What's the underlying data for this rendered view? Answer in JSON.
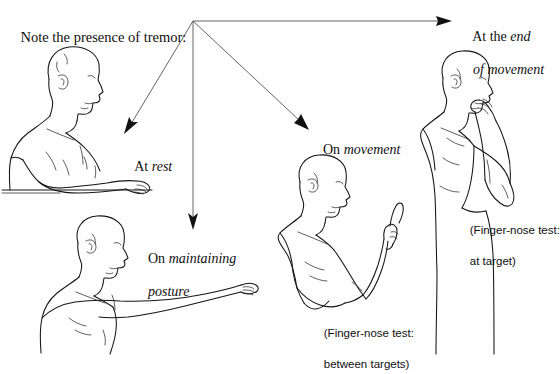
{
  "page": {
    "title": "Note the presence of tremor:",
    "background_color": "#fefefe",
    "ink_color": "#151515",
    "arrow_color": "#555555"
  },
  "header": {
    "text": "Note the presence of tremor:"
  },
  "labels": {
    "at_rest": {
      "prefix": "At ",
      "emphasis": "rest"
    },
    "on_maintaining_posture": {
      "prefix": "On ",
      "emphasis_line1": "maintaining",
      "emphasis_line2": "posture"
    },
    "on_movement": {
      "prefix": "On ",
      "emphasis": "movement"
    },
    "at_end_of_movement": {
      "prefix": "At the ",
      "emphasis_line1": "end",
      "emphasis_line2": "of movement"
    }
  },
  "captions": {
    "between_targets_line1": "(Finger-nose test:",
    "between_targets_line2": "between targets)",
    "at_target_line1": "(Finger-nose test:",
    "at_target_line2": "at target)"
  },
  "figures": [
    {
      "name": "seated-man-arm-at-rest-on-table",
      "label_ref": "at_rest",
      "position": "left-upper"
    },
    {
      "name": "standing-man-arm-extended-forward",
      "label_ref": "on_maintaining_posture",
      "position": "left-lower"
    },
    {
      "name": "man-forearm-raised-finger-pointing",
      "label_ref": "on_movement",
      "position": "center-lower"
    },
    {
      "name": "man-finger-touching-nose",
      "label_ref": "at_end_of_movement",
      "position": "right-upper"
    }
  ],
  "arrows": {
    "origin_x": 193,
    "origin_y": 21,
    "targets": [
      {
        "name": "arrow-to-at-rest",
        "x": 126,
        "y": 131
      },
      {
        "name": "arrow-to-on-maintaining-posture",
        "x": 193,
        "y": 227
      },
      {
        "name": "arrow-to-on-movement",
        "x": 305,
        "y": 126
      },
      {
        "name": "arrow-to-at-end-of-movement",
        "x": 447,
        "y": 21
      }
    ]
  }
}
